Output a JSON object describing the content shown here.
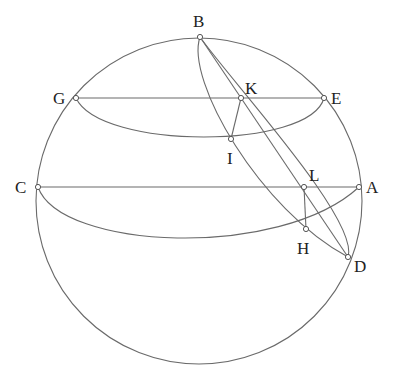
{
  "diagram": {
    "type": "spherical geometry figure",
    "sphere": {
      "cx": 199,
      "cy": 201,
      "r": 163
    },
    "points": {
      "A": {
        "x": 359,
        "y": 187,
        "label": "A",
        "lx": 366,
        "ly": 193
      },
      "B": {
        "x": 200,
        "y": 37,
        "label": "B",
        "lx": 193,
        "ly": 27
      },
      "C": {
        "x": 38,
        "y": 187,
        "label": "C",
        "lx": 15,
        "ly": 193
      },
      "D": {
        "x": 348,
        "y": 257,
        "label": "D",
        "lx": 354,
        "ly": 272
      },
      "E": {
        "x": 324,
        "y": 98,
        "label": "E",
        "lx": 331,
        "ly": 104
      },
      "G": {
        "x": 76,
        "y": 98,
        "label": "G",
        "lx": 53,
        "ly": 104
      },
      "H": {
        "x": 306,
        "y": 229,
        "label": "H",
        "lx": 297,
        "ly": 254
      },
      "I": {
        "x": 231,
        "y": 139,
        "label": "I",
        "lx": 227,
        "ly": 164
      },
      "K": {
        "x": 241,
        "y": 98,
        "label": "K",
        "lx": 245,
        "ly": 94
      },
      "L": {
        "x": 304,
        "y": 187,
        "label": "L",
        "lx": 309,
        "ly": 181
      }
    },
    "segments": [
      [
        "G",
        "E"
      ],
      [
        "C",
        "A"
      ],
      [
        "B",
        "D"
      ],
      [
        "K",
        "I"
      ],
      [
        "L",
        "H"
      ]
    ]
  }
}
